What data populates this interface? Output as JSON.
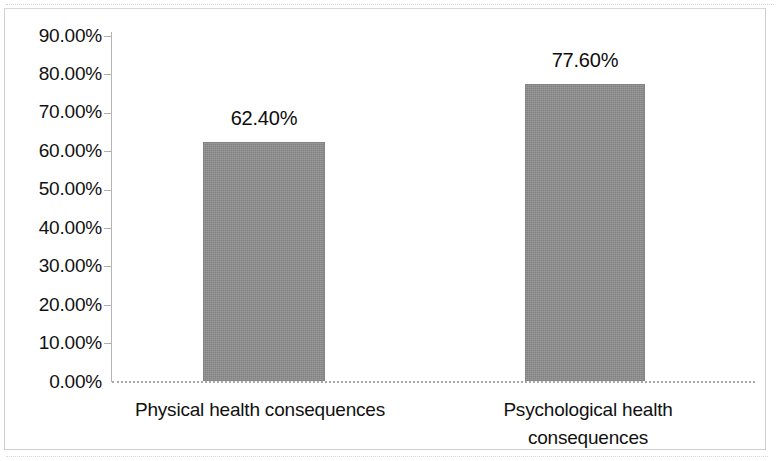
{
  "chart_data": {
    "type": "bar",
    "title": "",
    "subtitle": "",
    "xlabel": "",
    "ylabel": "",
    "categories": [
      "Physical health consequences",
      "Psychological health consequences"
    ],
    "values": [
      62.4,
      77.6
    ],
    "value_labels": [
      "62.40%",
      "77.60%"
    ],
    "ylim": [
      0,
      90
    ],
    "ytick_step": 10,
    "ytick_labels": [
      "90.00%",
      "80.00%",
      "70.00%",
      "60.00%",
      "50.00%",
      "40.00%",
      "30.00%",
      "20.00%",
      "10.00%",
      "0.00%"
    ],
    "ytick_values": [
      90,
      80,
      70,
      60,
      50,
      40,
      30,
      20,
      10,
      0
    ],
    "grid": false,
    "legend": null,
    "legend_position": "none",
    "series": [
      {
        "name": "",
        "values": [
          62.4,
          77.6
        ]
      }
    ],
    "annotations": []
  },
  "colors": {
    "bar_fill": "#8e8e8e",
    "bar_stroke": "#848484",
    "axis": "#b0b0b0",
    "text": "#111111",
    "frame": "#cfcfcf",
    "background": "#ffffff"
  },
  "category_label_lines": [
    [
      "Physical health consequences"
    ],
    [
      "Psychological health",
      "consequences"
    ]
  ]
}
